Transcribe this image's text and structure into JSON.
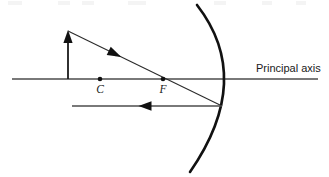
{
  "figure": {
    "kind": "concave-mirror-ray-diagram",
    "background_color": "#ffffff",
    "width": 329,
    "height": 177
  },
  "principal_axis": {
    "label": "Principal axis",
    "label_x": 256,
    "label_y": 72,
    "x1": 12,
    "y1": 79,
    "x2": 318,
    "y2": 79,
    "color": "#4d4d4d"
  },
  "points": [
    {
      "id": "center-of-curvature",
      "label": "C",
      "x": 100,
      "y": 79,
      "label_x": 100,
      "label_y": 93
    },
    {
      "id": "focal-point",
      "label": "F",
      "x": 163,
      "y": 79,
      "label_x": 163,
      "label_y": 93
    }
  ],
  "object": {
    "id": "object-arrow",
    "base_x": 68,
    "base_y": 79,
    "tip_x": 68,
    "tip_y": 31,
    "color": "#1a1a1a"
  },
  "mirror": {
    "id": "concave-mirror",
    "vertex_x": 227,
    "vertex_y": 79,
    "top_x": 197,
    "top_y": 5,
    "bottom_x": 190,
    "bottom_y": 172,
    "color": "#111111",
    "orientation": "concave-facing-left"
  },
  "rays": [
    {
      "id": "incident-ray",
      "description": "ray from object tip through F to mirror surface",
      "x1": 68,
      "y1": 31,
      "x2": 222,
      "y2": 106,
      "arrow_x": 115,
      "arrow_y": 54,
      "arrow_direction": "right-down",
      "color": "#2b2b2b"
    },
    {
      "id": "reflected-ray",
      "description": "reflected ray parallel to principal axis travelling left",
      "x1": 222,
      "y1": 106,
      "x2": 72,
      "y2": 106,
      "arrow_x": 145,
      "arrow_y": 106,
      "arrow_direction": "left",
      "color": "#4d4d4d"
    }
  ],
  "top_artifacts": [
    {
      "left": 8,
      "width": 14
    },
    {
      "left": 58,
      "width": 12
    },
    {
      "left": 82,
      "width": 12
    },
    {
      "left": 128,
      "width": 18
    },
    {
      "left": 214,
      "width": 12
    },
    {
      "left": 262,
      "width": 10
    },
    {
      "left": 296,
      "width": 10
    }
  ]
}
